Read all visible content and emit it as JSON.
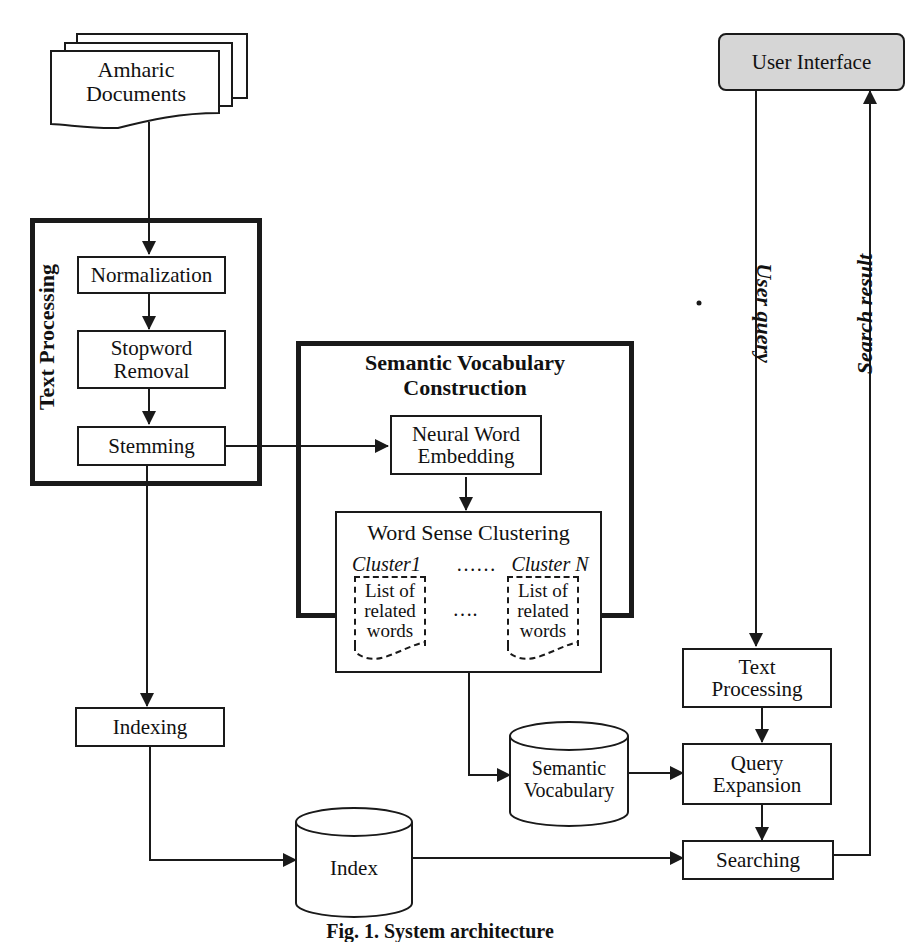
{
  "diagram": {
    "source": {
      "label_line1": "Amharic",
      "label_line2": "Documents"
    },
    "text_processing_group": {
      "title": "Text  Processing",
      "steps": [
        {
          "label_line1": "Normalization",
          "label_line2": ""
        },
        {
          "label_line1": "Stopword",
          "label_line2": "Removal"
        },
        {
          "label_line1": "Stemming",
          "label_line2": ""
        }
      ]
    },
    "semantic_group": {
      "title_line1": "Semantic Vocabulary",
      "title_line2": "Construction",
      "embedding": {
        "label_line1": "Neural Word",
        "label_line2": "Embedding"
      },
      "clustering": {
        "title": "Word Sense Clustering",
        "cluster_first": "Cluster1",
        "cluster_sep": "……",
        "cluster_last": "Cluster N",
        "doc_line1": "List of",
        "doc_line2": "related",
        "doc_line3": "words",
        "middle_dots": "…."
      }
    },
    "indexing": {
      "label": "Indexing"
    },
    "index_store": {
      "label": "Index"
    },
    "semantic_store": {
      "label_line1": "Semantic",
      "label_line2": "Vocabulary"
    },
    "user_interface": {
      "label": "User Interface"
    },
    "query_text_processing": {
      "label_line1": "Text",
      "label_line2": "Processing"
    },
    "query_expansion": {
      "label_line1": "Query",
      "label_line2": "Expansion"
    },
    "searching": {
      "label": "Searching"
    },
    "edge_labels": {
      "user_query": "User query",
      "search_result": "Search result"
    },
    "caption": "Fig. 1.  System architecture"
  },
  "colors": {
    "stroke": "#1a1a1a",
    "ui_fill": "#d6d6d6",
    "background": "#ffffff"
  }
}
